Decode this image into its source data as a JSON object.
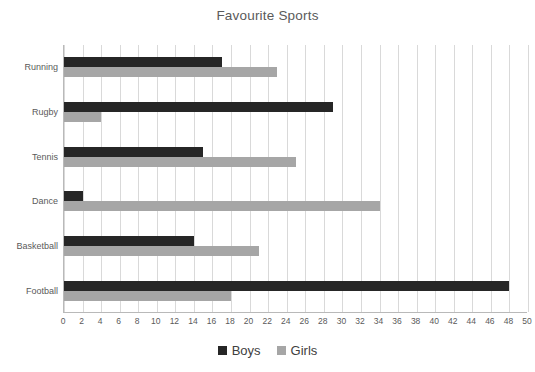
{
  "chart_data": {
    "type": "bar",
    "orientation": "horizontal",
    "title": "Favourite Sports",
    "xlabel": "",
    "ylabel": "",
    "xlim": [
      0,
      50
    ],
    "xtick_step": 2,
    "grid": "vertical",
    "legend_position": "bottom",
    "categories": [
      "Running",
      "Rugby",
      "Tennis",
      "Dance",
      "Basketball",
      "Football"
    ],
    "xticks": [
      "0",
      "2",
      "4",
      "6",
      "8",
      "10",
      "12",
      "14",
      "16",
      "18",
      "20",
      "22",
      "24",
      "26",
      "28",
      "30",
      "32",
      "34",
      "36",
      "38",
      "40",
      "42",
      "44",
      "46",
      "48",
      "50"
    ],
    "series": [
      {
        "name": "Boys",
        "color": "#262626",
        "values": [
          17,
          29,
          15,
          2,
          14,
          48
        ]
      },
      {
        "name": "Girls",
        "color": "#a6a6a6",
        "values": [
          23,
          4,
          25,
          34,
          21,
          18
        ]
      }
    ]
  },
  "colors": {
    "boys": "#262626",
    "girls": "#a6a6a6",
    "gridline": "#d9d9d9",
    "axis": "#b9b9b9",
    "text": "#5a5a5a",
    "background": "#ffffff"
  }
}
